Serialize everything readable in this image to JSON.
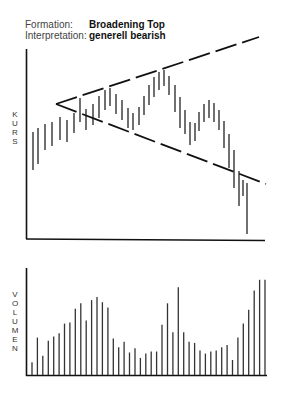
{
  "header": {
    "formation_label": "Formation:",
    "formation_value": "Broadening Top",
    "interpretation_label": "Interpretation:",
    "interpretation_value": "generell bearish"
  },
  "price_axis_label": "KURS",
  "volume_axis_label": "VOLUMEN",
  "chart_data": [
    {
      "type": "bar",
      "title": "Broadening Top — Kurs",
      "ylabel": "KURS",
      "xlabel": "",
      "grid": false,
      "description": "OHLC-style high-low bars with two diverging dashed trendlines (broadening formation)",
      "bars": [
        {
          "x": 33,
          "top": 132,
          "bottom": 170
        },
        {
          "x": 38,
          "top": 128,
          "bottom": 164
        },
        {
          "x": 45,
          "top": 124,
          "bottom": 150
        },
        {
          "x": 52,
          "top": 122,
          "bottom": 146
        },
        {
          "x": 60,
          "top": 117,
          "bottom": 140
        },
        {
          "x": 67,
          "top": 120,
          "bottom": 142
        },
        {
          "x": 74,
          "top": 113,
          "bottom": 133
        },
        {
          "x": 80,
          "top": 98,
          "bottom": 122
        },
        {
          "x": 86,
          "top": 109,
          "bottom": 130
        },
        {
          "x": 93,
          "top": 104,
          "bottom": 125
        },
        {
          "x": 99,
          "top": 96,
          "bottom": 118
        },
        {
          "x": 105,
          "top": 90,
          "bottom": 110
        },
        {
          "x": 110,
          "top": 88,
          "bottom": 106
        },
        {
          "x": 116,
          "top": 94,
          "bottom": 114
        },
        {
          "x": 122,
          "top": 100,
          "bottom": 120
        },
        {
          "x": 128,
          "top": 108,
          "bottom": 128
        },
        {
          "x": 133,
          "top": 113,
          "bottom": 130
        },
        {
          "x": 139,
          "top": 107,
          "bottom": 125
        },
        {
          "x": 144,
          "top": 96,
          "bottom": 115
        },
        {
          "x": 149,
          "top": 85,
          "bottom": 105
        },
        {
          "x": 154,
          "top": 77,
          "bottom": 97
        },
        {
          "x": 159,
          "top": 72,
          "bottom": 90
        },
        {
          "x": 164,
          "top": 70,
          "bottom": 86
        },
        {
          "x": 169,
          "top": 76,
          "bottom": 95
        },
        {
          "x": 175,
          "top": 85,
          "bottom": 112
        },
        {
          "x": 180,
          "top": 97,
          "bottom": 128
        },
        {
          "x": 185,
          "top": 110,
          "bottom": 134
        },
        {
          "x": 190,
          "top": 122,
          "bottom": 145
        },
        {
          "x": 195,
          "top": 123,
          "bottom": 141
        },
        {
          "x": 199,
          "top": 112,
          "bottom": 131
        },
        {
          "x": 204,
          "top": 104,
          "bottom": 122
        },
        {
          "x": 209,
          "top": 100,
          "bottom": 118
        },
        {
          "x": 214,
          "top": 103,
          "bottom": 122
        },
        {
          "x": 219,
          "top": 110,
          "bottom": 130
        },
        {
          "x": 224,
          "top": 121,
          "bottom": 148
        },
        {
          "x": 229,
          "top": 134,
          "bottom": 168
        },
        {
          "x": 234,
          "top": 150,
          "bottom": 188
        },
        {
          "x": 239,
          "top": 171,
          "bottom": 206
        },
        {
          "x": 243,
          "top": 180,
          "bottom": 196
        },
        {
          "x": 247,
          "top": 183,
          "bottom": 234
        }
      ],
      "trendlines": [
        {
          "name": "upper resistance (rising)",
          "from": [
            56,
            104
          ],
          "to": [
            259,
            37
          ],
          "style": "dashed"
        },
        {
          "name": "lower support (falling)",
          "from": [
            56,
            104
          ],
          "to": [
            266,
            184
          ],
          "style": "dashed"
        }
      ]
    },
    {
      "type": "bar",
      "title": "Volumen",
      "ylabel": "VOLUMEN",
      "xlabel": "",
      "grid": false,
      "categories": [
        1,
        2,
        3,
        4,
        5,
        6,
        7,
        8,
        9,
        10,
        11,
        12,
        13,
        14,
        15,
        16,
        17,
        18,
        19,
        20,
        21,
        22,
        23,
        24,
        25,
        26,
        27,
        28,
        29,
        30,
        31,
        32,
        33,
        34,
        35,
        36,
        37,
        38,
        39,
        40,
        41,
        42,
        43,
        44
      ],
      "values": [
        12,
        35,
        18,
        32,
        36,
        39,
        48,
        49,
        62,
        67,
        51,
        70,
        73,
        68,
        63,
        34,
        26,
        31,
        21,
        25,
        16,
        20,
        22,
        22,
        47,
        67,
        40,
        82,
        40,
        31,
        30,
        23,
        20,
        22,
        23,
        26,
        28,
        14,
        35,
        48,
        61,
        79,
        89,
        89
      ],
      "ylim": [
        0,
        100
      ]
    }
  ]
}
